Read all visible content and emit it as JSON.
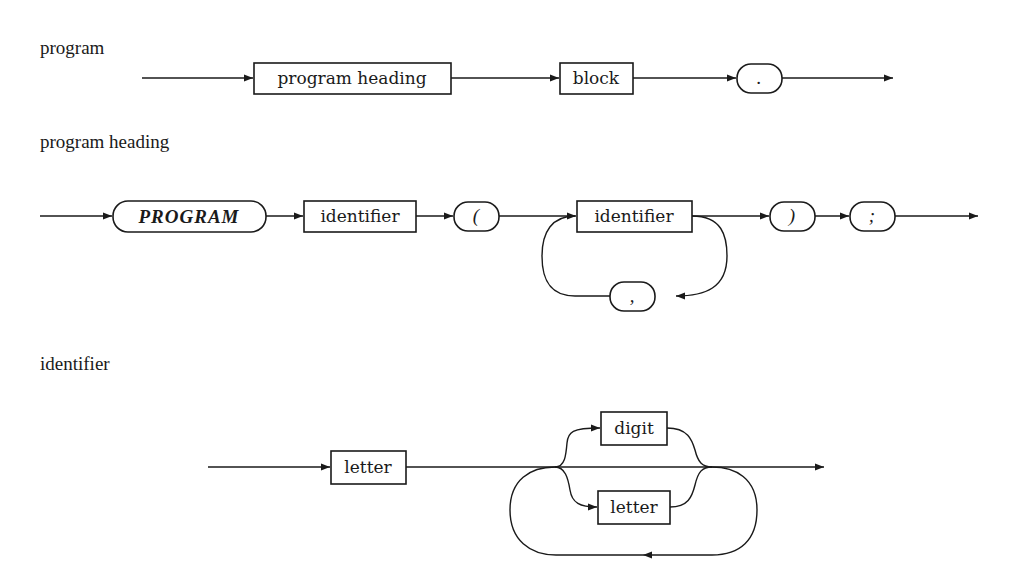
{
  "diagram": {
    "type": "syntax-diagram",
    "colors": {
      "ink": "#1a1a1a",
      "background": "#ffffff"
    },
    "sections": [
      {
        "title": "program",
        "elements": [
          {
            "kind": "nonterminal",
            "label": "program heading"
          },
          {
            "kind": "nonterminal",
            "label": "block"
          },
          {
            "kind": "terminal",
            "label": "."
          }
        ]
      },
      {
        "title": "program heading",
        "elements": [
          {
            "kind": "keyword",
            "label": "PROGRAM"
          },
          {
            "kind": "nonterminal",
            "label": "identifier"
          },
          {
            "kind": "terminal",
            "label": "("
          },
          {
            "kind": "nonterminal",
            "label": "identifier"
          },
          {
            "kind": "terminal",
            "label": ","
          },
          {
            "kind": "terminal",
            "label": ")"
          },
          {
            "kind": "terminal",
            "label": ";"
          }
        ]
      },
      {
        "title": "identifier",
        "elements": [
          {
            "kind": "nonterminal",
            "label": "letter"
          },
          {
            "kind": "nonterminal",
            "label": "digit"
          },
          {
            "kind": "nonterminal",
            "label": "letter"
          }
        ]
      }
    ]
  }
}
